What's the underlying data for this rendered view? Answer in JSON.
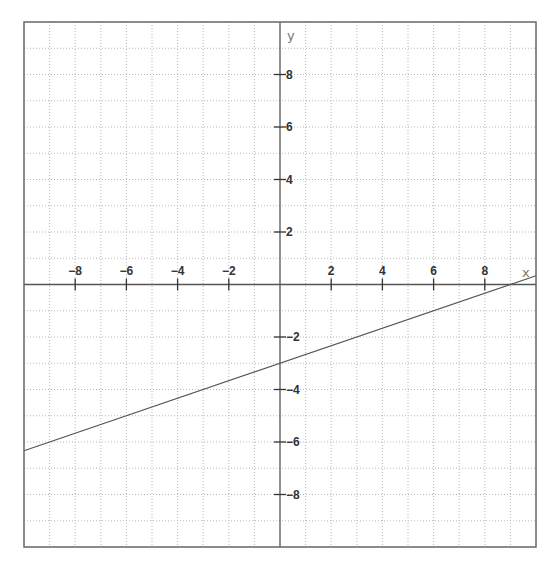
{
  "chart_data": {
    "type": "line",
    "title": "",
    "xlabel": "x",
    "ylabel": "y",
    "xlim": [
      -10,
      10
    ],
    "ylim": [
      -10,
      10
    ],
    "grid": true,
    "grid_step": 1,
    "x_ticks": [
      -8,
      -6,
      -4,
      -2,
      2,
      4,
      6,
      8
    ],
    "y_ticks": [
      8,
      6,
      4,
      2,
      -2,
      -4,
      -6,
      -8
    ],
    "x_tick_labels": [
      "-8",
      "-6",
      "-4",
      "-2",
      "2",
      "4",
      "6",
      "8"
    ],
    "y_tick_labels": [
      "8",
      "6",
      "4",
      "2",
      "-2",
      "-4",
      "-6",
      "-8"
    ],
    "series": [
      {
        "name": "y = x/3 - 3",
        "equation": "y = (1/3)x - 3",
        "slope": 0.3333,
        "intercept": -3,
        "x": [
          -10,
          -6,
          -3,
          0,
          3,
          6,
          9,
          10
        ],
        "y": [
          -6.33,
          -5,
          -4,
          -3,
          -2,
          -1,
          0,
          0.33
        ]
      }
    ]
  },
  "colors": {
    "grid": "#b8b8b8",
    "axis": "#555555",
    "line": "#555555",
    "text": "#333333",
    "background": "#ffffff"
  }
}
